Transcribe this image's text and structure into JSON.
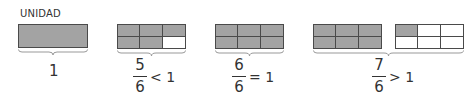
{
  "title": "UNIDAD",
  "colors": {
    "shaded": "#a3a3a3",
    "empty": "#ffffff",
    "stroke": "#4a4a4a"
  },
  "groups": [
    {
      "id": "unit",
      "label": "1",
      "bars": [
        {
          "type": "whole",
          "shaded": 1,
          "total": 1
        }
      ]
    },
    {
      "id": "five-sixths",
      "numerator": "5",
      "denominator": "6",
      "relation": "< 1",
      "bars": [
        {
          "type": "sixths",
          "shaded": 5,
          "total": 6
        }
      ]
    },
    {
      "id": "six-sixths",
      "numerator": "6",
      "denominator": "6",
      "relation": "= 1",
      "bars": [
        {
          "type": "sixths",
          "shaded": 6,
          "total": 6
        }
      ]
    },
    {
      "id": "seven-sixths",
      "numerator": "7",
      "denominator": "6",
      "relation": "> 1",
      "bars": [
        {
          "type": "sixths",
          "shaded": 6,
          "total": 6
        },
        {
          "type": "sixths",
          "shaded": 1,
          "total": 6
        }
      ]
    }
  ]
}
